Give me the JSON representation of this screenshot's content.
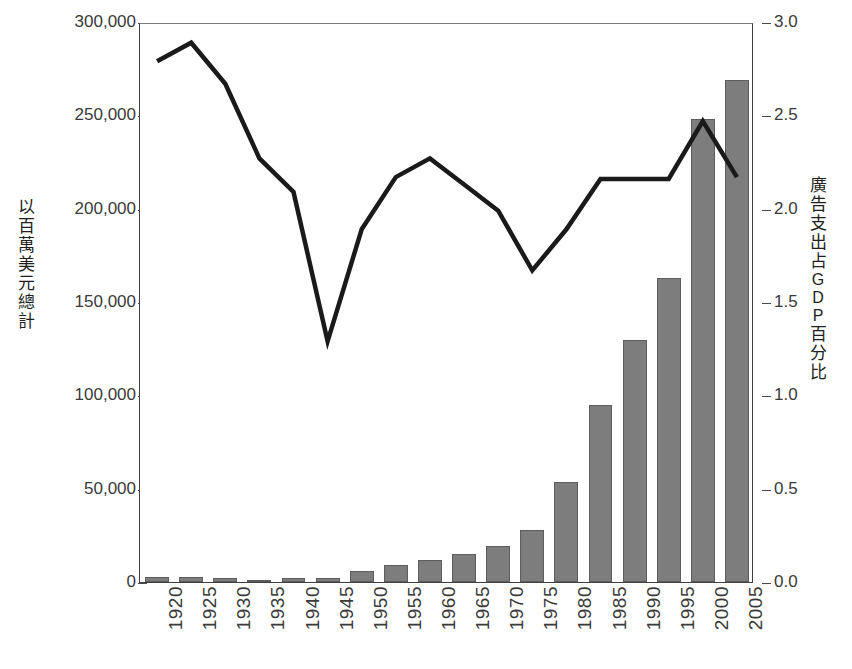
{
  "chart_data": {
    "type": "bar",
    "title": "",
    "xlabel": "",
    "ylabel": "以百萬美元總計",
    "ylabel2": "廣告支出占 GDP 百分比",
    "grid": false,
    "legend": "none",
    "categories": [
      "1920",
      "1925",
      "1930",
      "1935",
      "1940",
      "1945",
      "1950",
      "1955",
      "1960",
      "1965",
      "1970",
      "1975",
      "1980",
      "1985",
      "1990",
      "1995",
      "2000",
      "2005"
    ],
    "ylim": [
      0,
      300000
    ],
    "ylim2": [
      0.0,
      3.0
    ],
    "yticks": [
      "0",
      "50,000",
      "100,000",
      "150,000",
      "200,000",
      "250,000",
      "300,000"
    ],
    "ytick_values": [
      0,
      50000,
      100000,
      150000,
      200000,
      250000,
      300000
    ],
    "yticks2": [
      "0.0",
      "0.5",
      "1.0",
      "1.5",
      "2.0",
      "2.5",
      "3.0"
    ],
    "ytick2_values": [
      0.0,
      0.5,
      1.0,
      1.5,
      2.0,
      2.5,
      3.0
    ],
    "series": [
      {
        "name": "以百萬美元總計",
        "type": "bar",
        "axis": "left",
        "color": "#7d7d7d",
        "values": [
          2500,
          2600,
          2300,
          1200,
          2100,
          2200,
          5700,
          9200,
          12000,
          15000,
          19500,
          27900,
          53600,
          94800,
          129600,
          162900,
          248000,
          269000
        ]
      },
      {
        "name": "廣告支出占 GDP 百分比",
        "type": "line",
        "axis": "right",
        "color": "#1a1a1a",
        "values": [
          2.8,
          2.9,
          2.68,
          2.28,
          2.1,
          1.3,
          1.9,
          2.18,
          2.28,
          2.14,
          2.0,
          1.68,
          1.9,
          2.17,
          2.17,
          2.17,
          2.48,
          2.18
        ]
      }
    ]
  },
  "labels": {
    "left_axis_title_chars": [
      "以",
      "百",
      "萬",
      "美",
      "元",
      "總",
      "計"
    ],
    "right_axis_title_chars": [
      "廣",
      "告",
      "支",
      "出",
      "占",
      "G",
      "D",
      "P",
      "百",
      "分",
      "比"
    ]
  }
}
